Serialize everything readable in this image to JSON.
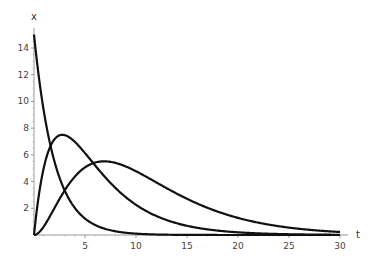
{
  "chart_data": {
    "type": "line",
    "title": "",
    "xlabel": "t",
    "ylabel": "x",
    "xlim": [
      0,
      30
    ],
    "ylim": [
      0,
      15
    ],
    "grid": false,
    "legend": null,
    "x_ticks": [
      5,
      10,
      15,
      20,
      25,
      30
    ],
    "y_ticks": [
      2,
      4,
      6,
      8,
      10,
      12,
      14
    ],
    "x": [
      0,
      0.5,
      1,
      1.5,
      2,
      2.5,
      3,
      3.5,
      4,
      5,
      6,
      7,
      8,
      9,
      10,
      11,
      12,
      13,
      14,
      15,
      16,
      17,
      18,
      19,
      20,
      21,
      22,
      23,
      24,
      25,
      26,
      27,
      28,
      29,
      30
    ],
    "series": [
      {
        "name": "curve-1",
        "values": [
          15.0,
          11.68,
          9.1,
          7.09,
          5.52,
          4.3,
          3.35,
          2.61,
          2.03,
          1.23,
          0.75,
          0.45,
          0.27,
          0.17,
          0.1,
          0.06,
          0.04,
          0.02,
          0.01,
          0.01,
          0.0,
          0.0,
          0.0,
          0.0,
          0.0,
          0.0,
          0.0,
          0.0,
          0.0,
          0.0,
          0.0,
          0.0,
          0.0,
          0.0,
          0.0
        ]
      },
      {
        "name": "curve-2",
        "values": [
          0.0,
          2.8,
          4.9,
          6.1,
          6.93,
          7.32,
          7.49,
          7.45,
          7.35,
          6.69,
          5.9,
          5.0,
          4.25,
          3.5,
          2.86,
          2.38,
          1.94,
          1.56,
          1.26,
          1.02,
          0.82,
          0.65,
          0.52,
          0.42,
          0.33,
          0.27,
          0.21,
          0.17,
          0.13,
          0.1,
          0.08,
          0.07,
          0.05,
          0.04,
          0.03
        ]
      },
      {
        "name": "curve-3",
        "values": [
          0.0,
          0.12,
          0.41,
          0.81,
          1.25,
          1.7,
          2.15,
          2.58,
          2.98,
          3.68,
          4.2,
          4.56,
          4.78,
          4.88,
          4.88,
          4.8,
          4.66,
          4.47,
          4.25,
          4.01,
          3.76,
          3.5,
          3.24,
          2.99,
          2.75,
          2.52,
          2.3,
          2.09,
          1.9,
          1.72,
          1.55,
          1.4,
          1.26,
          1.13,
          1.01
        ]
      }
    ]
  },
  "axes": {
    "x_label": "t",
    "y_label": "x",
    "x_tick_labels": [
      "5",
      "10",
      "15",
      "20",
      "25",
      "30"
    ],
    "y_tick_labels": [
      "2",
      "4",
      "6",
      "8",
      "10",
      "12",
      "14"
    ]
  }
}
